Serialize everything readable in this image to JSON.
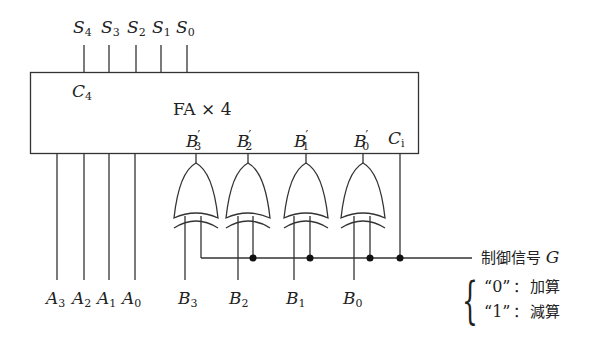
{
  "diagram": {
    "type": "4-bit adder/subtractor circuit",
    "block_label": "FA × 4",
    "carry_out": {
      "name": "C",
      "sub": "4"
    },
    "carry_in": {
      "name": "C",
      "sub": "i"
    },
    "sum_outputs": [
      {
        "name": "S",
        "sub": "4"
      },
      {
        "name": "S",
        "sub": "3"
      },
      {
        "name": "S",
        "sub": "2"
      },
      {
        "name": "S",
        "sub": "1"
      },
      {
        "name": "S",
        "sub": "0"
      }
    ],
    "a_inputs": [
      {
        "name": "A",
        "sub": "3"
      },
      {
        "name": "A",
        "sub": "2"
      },
      {
        "name": "A",
        "sub": "1"
      },
      {
        "name": "A",
        "sub": "0"
      }
    ],
    "b_prime_inputs": [
      {
        "name": "B",
        "sub": "3"
      },
      {
        "name": "B",
        "sub": "2"
      },
      {
        "name": "B",
        "sub": "1"
      },
      {
        "name": "B",
        "sub": "0"
      }
    ],
    "b_inputs": [
      {
        "name": "B",
        "sub": "3"
      },
      {
        "name": "B",
        "sub": "2"
      },
      {
        "name": "B",
        "sub": "1"
      },
      {
        "name": "B",
        "sub": "0"
      }
    ],
    "gates": [
      "XOR",
      "XOR",
      "XOR",
      "XOR"
    ],
    "control": {
      "label": "制御信号",
      "signal": "G",
      "options": [
        {
          "value": "“0”",
          "sep": "：",
          "meaning": "加算"
        },
        {
          "value": "“1”",
          "sep": "：",
          "meaning": "減算"
        }
      ]
    }
  }
}
